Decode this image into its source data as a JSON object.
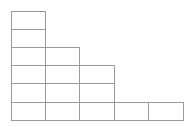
{
  "figure": {
    "kind": "young-diagram",
    "background_color": "#ffffff",
    "line_color": "#9a9a9a",
    "cell_fill_color": "#ffffff",
    "line_width": 1,
    "canvas": {
      "width": 192,
      "height": 127
    },
    "grid": {
      "origin_x": 11,
      "origin_y": 11,
      "cell_width": 34.4,
      "cell_height": 18.2,
      "columns": 5,
      "rows": 6
    },
    "column_heights": [
      6,
      4,
      3,
      1,
      1
    ],
    "row_lengths_top_to_bottom": [
      1,
      1,
      2,
      3,
      3,
      5
    ],
    "total_cells": 15,
    "cells": [
      {
        "row": 0,
        "col": 0
      },
      {
        "row": 1,
        "col": 0
      },
      {
        "row": 2,
        "col": 0
      },
      {
        "row": 2,
        "col": 1
      },
      {
        "row": 3,
        "col": 0
      },
      {
        "row": 3,
        "col": 1
      },
      {
        "row": 3,
        "col": 2
      },
      {
        "row": 4,
        "col": 0
      },
      {
        "row": 4,
        "col": 1
      },
      {
        "row": 4,
        "col": 2
      },
      {
        "row": 5,
        "col": 0
      },
      {
        "row": 5,
        "col": 1
      },
      {
        "row": 5,
        "col": 2
      },
      {
        "row": 5,
        "col": 3
      },
      {
        "row": 5,
        "col": 4
      }
    ]
  }
}
